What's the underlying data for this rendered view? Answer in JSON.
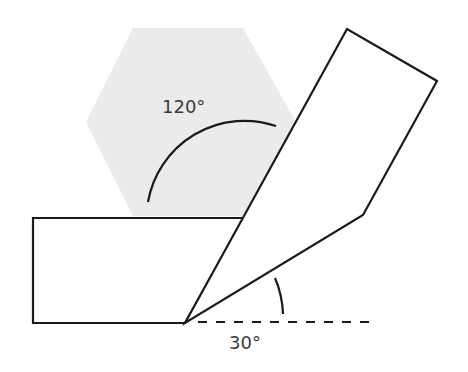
{
  "diagram": {
    "colors": {
      "stroke": "#1a1a1a",
      "hexagon_fill": "#ebebeb",
      "label": "#3a3a3a",
      "background": "#ffffff"
    },
    "hexagon": {
      "points": "133,28 243,28 296,122 243,216 133,216 86,122"
    },
    "left_block": {
      "points": "33,218 244,218 185,323 33,323"
    },
    "right_block": {
      "points": "185,323 347,29 437,81 363,215"
    },
    "dashed_line": {
      "x1": 198,
      "y1": 322,
      "x2": 375,
      "y2": 322
    },
    "angles": [
      {
        "label": "120°",
        "label_x": 162,
        "label_y": 113,
        "arc_path": "M 148 202 A 98 98 0 0 1 276 126"
      },
      {
        "label": "30°",
        "label_x": 229,
        "label_y": 349,
        "arc_path": "M 275 278 A 100 100 0 0 1 283 314"
      }
    ]
  }
}
